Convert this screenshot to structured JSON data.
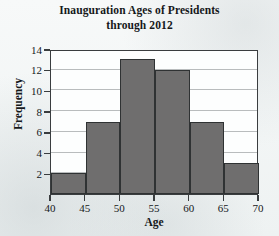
{
  "chart_data": {
    "type": "bar",
    "title": "Inauguration Ages of Presidents through 2012",
    "title_lines": [
      "Inauguration Ages of Presidents",
      "through 2012"
    ],
    "xlabel": "Age",
    "ylabel": "Frequency",
    "categories": [
      "40-45",
      "45-50",
      "50-55",
      "55-60",
      "60-65",
      "65-70"
    ],
    "bin_edges": [
      40,
      45,
      50,
      55,
      60,
      65,
      70
    ],
    "values": [
      2,
      7,
      13,
      12,
      7,
      3
    ],
    "xlim": [
      40,
      70
    ],
    "ylim": [
      0,
      14
    ],
    "xticks": [
      40,
      45,
      50,
      55,
      60,
      65,
      70
    ],
    "yticks": [
      2,
      4,
      6,
      8,
      10,
      12,
      14
    ],
    "grid": true,
    "legend": false,
    "bar_color": "#6f6e6e",
    "bar_edge_color": "#2f3233",
    "axis_color": "#3a3d3f",
    "grid_color": "#b9bcbd",
    "plot_background": "#fdfefe",
    "page_background": "#f4f6f6"
  }
}
